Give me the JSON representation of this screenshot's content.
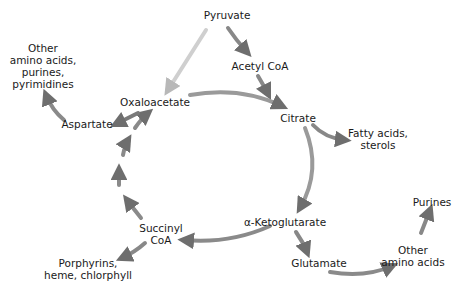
{
  "diagram": {
    "type": "metabolic-pathway",
    "nodes": {
      "pyruvate": "Pyruvate",
      "acetyl_coa": "Acetyl CoA",
      "citrate": "Citrate",
      "fatty_acids": [
        "Fatty acids,",
        "sterols"
      ],
      "oxaloacetate": "Oxaloacetate",
      "aspartate": "Aspartate",
      "other_aa_top": [
        "Other",
        "amino acids,",
        "purines,",
        "pyrimidines"
      ],
      "alpha_kg": "α-Ketoglutarate",
      "glutamate": "Glutamate",
      "other_aa_right": [
        "Other",
        "amino acids"
      ],
      "purines": "Purines",
      "succinyl_coa": [
        "Succinyl",
        "CoA"
      ],
      "porphyrins": [
        "Porphyrins,",
        "heme, chlorphyll"
      ]
    },
    "edges": [
      [
        "Pyruvate",
        "Acetyl CoA"
      ],
      [
        "Pyruvate",
        "Oxaloacetate"
      ],
      [
        "Acetyl CoA",
        "Citrate"
      ],
      [
        "Oxaloacetate",
        "Citrate"
      ],
      [
        "Citrate",
        "Fatty acids, sterols"
      ],
      [
        "Citrate",
        "α-Ketoglutarate"
      ],
      [
        "α-Ketoglutarate",
        "Succinyl CoA"
      ],
      [
        "α-Ketoglutarate",
        "Glutamate"
      ],
      [
        "Glutamate",
        "Other amino acids"
      ],
      [
        "Other amino acids",
        "Purines"
      ],
      [
        "Succinyl CoA",
        "Porphyrins, heme, chlorphyll"
      ],
      [
        "Succinyl CoA",
        "Oxaloacetate"
      ],
      [
        "Oxaloacetate",
        "Aspartate"
      ],
      [
        "Aspartate",
        "Other amino acids, purines, pyrimidines"
      ]
    ],
    "colors": {
      "arrow": "#6e6e6e",
      "arrow_light": "#d6d6d6",
      "text": "#1a1a1a"
    }
  }
}
